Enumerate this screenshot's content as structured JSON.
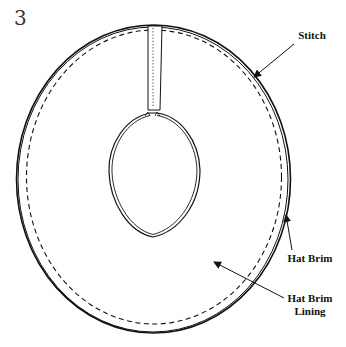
{
  "figure": {
    "step_number": "3",
    "labels": {
      "stitch": "Stitch",
      "hat_brim": "Hat Brim",
      "hat_brim_lining_line1": "Hat Brim",
      "hat_brim_lining_line2": "Lining"
    },
    "colors": {
      "ink": "#111111",
      "background": "#ffffff"
    }
  }
}
